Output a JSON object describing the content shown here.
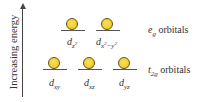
{
  "axis": {
    "label": "Increasing energy",
    "direction": "up"
  },
  "colors": {
    "orbital_fill": "#efcc2c",
    "orbital_outline": "#6b4e12",
    "line": "#555555",
    "text": "#333333"
  },
  "groups": [
    {
      "name": "eg",
      "symbol": "e",
      "subscript": "g",
      "suffix": "orbitals",
      "level": "upper",
      "orbitals": [
        {
          "base": "d",
          "sub": "z",
          "sup": "2",
          "label": "d_z2"
        },
        {
          "base": "d",
          "sub": "x",
          "sup": "2",
          "sub2": "−y",
          "sup2": "2",
          "label": "d_x2-y2"
        }
      ]
    },
    {
      "name": "t2g",
      "symbol": "t",
      "subscript": "2g",
      "suffix": "orbitals",
      "level": "lower",
      "orbitals": [
        {
          "base": "d",
          "sub": "xy",
          "label": "d_xy"
        },
        {
          "base": "d",
          "sub": "xz",
          "label": "d_xz"
        },
        {
          "base": "d",
          "sub": "yz",
          "label": "d_yz"
        }
      ]
    }
  ]
}
